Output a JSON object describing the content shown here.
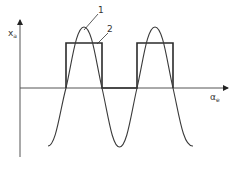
{
  "diagram": {
    "y_axis_label": "x",
    "y_axis_subscript": "a",
    "x_axis_label": "α",
    "x_axis_subscript": "e",
    "curve_labels": [
      {
        "id": "1",
        "text": "1",
        "describes": "sinusoidal curve"
      },
      {
        "id": "2",
        "text": "2",
        "describes": "rectangular pulse waveform"
      }
    ],
    "colors": {
      "line": "#2b2b2b",
      "axis": "#555555",
      "background": "#ffffff"
    }
  }
}
